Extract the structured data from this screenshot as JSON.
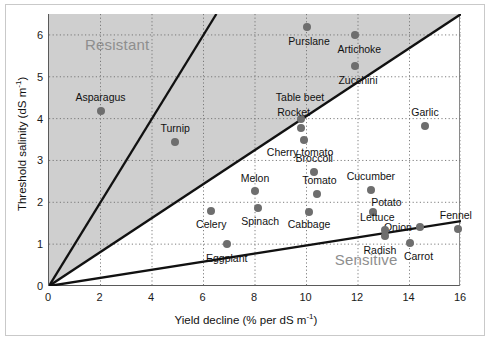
{
  "chart_data": {
    "type": "scatter",
    "title": "",
    "xlabel": "Yield decline (% per dS m-1)",
    "ylabel": "Threshold salinity (dS m-1)",
    "xlabel_main": "Yield decline (% per dS m",
    "xlabel_sup": "-1",
    "xlabel_tail": ")",
    "ylabel_main": "Threshold salinity (dS m",
    "ylabel_sup": "-1",
    "ylabel_tail": ")",
    "xlim": [
      0,
      16
    ],
    "ylim": [
      0,
      6.5
    ],
    "grid": true,
    "xticks": [
      0,
      2,
      4,
      6,
      8,
      10,
      12,
      14,
      16
    ],
    "yticks": [
      0,
      1,
      2,
      3,
      4,
      5,
      6
    ],
    "xtick_labels": [
      "0",
      "2",
      "4",
      "6",
      "8",
      "10",
      "12",
      "14",
      "16"
    ],
    "ytick_labels": [
      "0",
      "1",
      "2",
      "3",
      "4",
      "5",
      "6"
    ],
    "legend_position": "none",
    "annotations": [
      {
        "text": "Resistant",
        "x": 1.4,
        "y": 5.75,
        "color": "#8e8e8e"
      },
      {
        "text": "Sensitive",
        "x": 11.1,
        "y": 0.62,
        "color": "#8e8e8e"
      }
    ],
    "shaded_region": {
      "label": "Resistant zone",
      "color": "#cfcfcf",
      "description": "Gray region above the 1:2.46 boundary line"
    },
    "reference_lines": [
      {
        "name": "steep-boundary-line",
        "x": [
          0,
          6.5
        ],
        "y": [
          0,
          6.5
        ],
        "color": "#111111"
      },
      {
        "name": "middle-boundary-line",
        "x": [
          0,
          16
        ],
        "y": [
          0,
          6.5
        ],
        "color": "#111111"
      },
      {
        "name": "shallow-boundary-line",
        "x": [
          0,
          16
        ],
        "y": [
          0,
          1.55
        ],
        "color": "#111111"
      }
    ],
    "points": [
      {
        "label": "Asparagus",
        "x": 2.0,
        "y": 4.18,
        "label_dx": 0,
        "label_dy": 0.33
      },
      {
        "label": "Turnip",
        "x": 4.9,
        "y": 3.45,
        "label_dx": 0,
        "label_dy": 0.33
      },
      {
        "label": "Purslane",
        "x": 10.0,
        "y": 6.18,
        "label_dx": 0.1,
        "label_dy": -0.33
      },
      {
        "label": "Artichoke",
        "x": 11.9,
        "y": 6.0,
        "label_dx": 0.15,
        "label_dy": -0.33
      },
      {
        "label": "Zucchini",
        "x": 11.9,
        "y": 5.25,
        "label_dx": 0.1,
        "label_dy": -0.33
      },
      {
        "label": "Table beet",
        "x": 9.8,
        "y": 4.0,
        "label_dx": -0.05,
        "label_dy": 0.52
      },
      {
        "label": "Rocket",
        "x": 9.8,
        "y": 3.78,
        "label_dx": -0.3,
        "label_dy": 0.38
      },
      {
        "label": "Cherry tomato",
        "x": 9.9,
        "y": 3.5,
        "label_dx": -0.15,
        "label_dy": -0.3
      },
      {
        "label": "Garlic",
        "x": 14.6,
        "y": 3.82,
        "label_dx": 0,
        "label_dy": 0.33
      },
      {
        "label": "Broccoli",
        "x": 10.3,
        "y": 2.72,
        "label_dx": 0,
        "label_dy": 0.33
      },
      {
        "label": "Melon",
        "x": 8.0,
        "y": 2.26,
        "label_dx": 0,
        "label_dy": 0.33
      },
      {
        "label": "Tomato",
        "x": 10.4,
        "y": 2.2,
        "label_dx": 0.1,
        "label_dy": 0.33
      },
      {
        "label": "Cucumber",
        "x": 12.5,
        "y": 2.3,
        "label_dx": 0,
        "label_dy": 0.33
      },
      {
        "label": "Spinach",
        "x": 8.1,
        "y": 1.86,
        "label_dx": 0.1,
        "label_dy": -0.3
      },
      {
        "label": "Celery",
        "x": 6.3,
        "y": 1.8,
        "label_dx": 0,
        "label_dy": -0.33
      },
      {
        "label": "Cabbage",
        "x": 10.1,
        "y": 1.78,
        "label_dx": 0,
        "label_dy": -0.3
      },
      {
        "label": "Potato",
        "x": 12.6,
        "y": 1.78,
        "label_dx": 0.5,
        "label_dy": 0.22
      },
      {
        "label": "Onion",
        "x": 14.4,
        "y": 1.4,
        "label_dx": -0.85,
        "label_dy": 0.0
      },
      {
        "label": "Fennel",
        "x": 15.9,
        "y": 1.37,
        "label_dx": -0.1,
        "label_dy": 0.33
      },
      {
        "label": "Lettuce",
        "x": 13.05,
        "y": 1.34,
        "label_dx": -0.3,
        "label_dy": 0.3
      },
      {
        "label": "Radish",
        "x": 13.05,
        "y": 1.2,
        "label_dx": -0.2,
        "label_dy": -0.33
      },
      {
        "label": "Carrot",
        "x": 14.0,
        "y": 1.02,
        "label_dx": 0.35,
        "label_dy": -0.3
      },
      {
        "label": "Eggplant",
        "x": 6.9,
        "y": 1.0,
        "label_dx": 0,
        "label_dy": -0.33
      }
    ]
  }
}
